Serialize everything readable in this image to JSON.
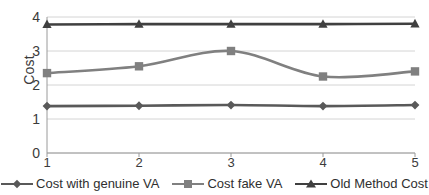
{
  "chart_data": {
    "type": "line",
    "title": "",
    "xlabel": "",
    "ylabel": "Cost",
    "categories": [
      "1",
      "2",
      "3",
      "4",
      "5"
    ],
    "x": [
      1,
      2,
      3,
      4,
      5
    ],
    "ylim": [
      0,
      4
    ],
    "yticks": [
      "0",
      "1",
      "2",
      "3",
      "4"
    ],
    "grid": true,
    "smooth": true,
    "legend_position": "bottom",
    "series": [
      {
        "name": "Cost with genuine VA",
        "marker": "diamond",
        "color": "#595959",
        "values": [
          1.38,
          1.39,
          1.41,
          1.38,
          1.41
        ]
      },
      {
        "name": "Cost fake VA",
        "marker": "square",
        "color": "#808080",
        "values": [
          2.35,
          2.55,
          3.0,
          2.25,
          2.4
        ]
      },
      {
        "name": "Old Method Cost",
        "marker": "triangle",
        "color": "#404040",
        "values": [
          3.78,
          3.79,
          3.79,
          3.79,
          3.8
        ]
      }
    ]
  },
  "axis": {
    "y_title": "Cost",
    "y_ticks": [
      "4",
      "3",
      "2",
      "1",
      "0"
    ],
    "x_ticks": [
      "1",
      "2",
      "3",
      "4",
      "5"
    ]
  },
  "legend": {
    "items": [
      {
        "label": "Cost with genuine VA",
        "marker": "diamond-marker",
        "color": "#595959"
      },
      {
        "label": "Cost fake VA",
        "marker": "square-marker",
        "color": "#808080"
      },
      {
        "label": "Old Method Cost",
        "marker": "triangle-marker",
        "color": "#404040"
      }
    ]
  },
  "colors": {
    "grid": "#d4d4d4",
    "axis": "#9a9a9a",
    "text": "#3b3b3b",
    "background": "#ffffff"
  }
}
